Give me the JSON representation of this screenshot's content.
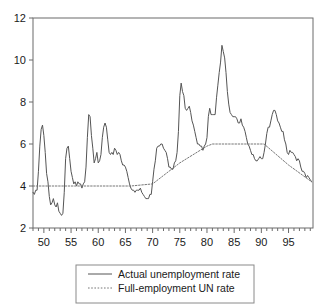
{
  "chart_data": {
    "type": "line",
    "title": "",
    "subtitle": "",
    "xlabel": "",
    "ylabel": "",
    "xlim": [
      1948.0,
      1999.5
    ],
    "ylim": [
      2,
      12
    ],
    "grid": false,
    "legend_position": "bottom-center",
    "y_ticks": [
      2,
      4,
      6,
      8,
      10,
      12
    ],
    "y_tick_labels": [
      "2",
      "4",
      "6",
      "8",
      "10",
      "12"
    ],
    "x_ticks": [
      1950,
      1955,
      1960,
      1965,
      1970,
      1975,
      1980,
      1985,
      1990,
      1995
    ],
    "x_tick_labels": [
      "50",
      "55",
      "60",
      "65",
      "70",
      "75",
      "80",
      "85",
      "90",
      "95"
    ],
    "x_minor_tick_step": 1,
    "series": [
      {
        "name": "Actual unemployment rate",
        "style": "solid",
        "color": "#555555",
        "x": [
          1948.0,
          1948.25,
          1948.5,
          1948.75,
          1949.0,
          1949.25,
          1949.5,
          1949.75,
          1950.0,
          1950.25,
          1950.5,
          1950.75,
          1951.0,
          1951.25,
          1951.5,
          1951.75,
          1952.0,
          1952.25,
          1952.5,
          1952.75,
          1953.0,
          1953.25,
          1953.5,
          1953.75,
          1954.0,
          1954.25,
          1954.5,
          1954.75,
          1955.0,
          1955.25,
          1955.5,
          1955.75,
          1956.0,
          1956.25,
          1956.5,
          1956.75,
          1957.0,
          1957.25,
          1957.5,
          1957.75,
          1958.0,
          1958.25,
          1958.5,
          1958.75,
          1959.0,
          1959.25,
          1959.5,
          1959.75,
          1960.0,
          1960.25,
          1960.5,
          1960.75,
          1961.0,
          1961.25,
          1961.5,
          1961.75,
          1962.0,
          1962.25,
          1962.5,
          1962.75,
          1963.0,
          1963.25,
          1963.5,
          1963.75,
          1964.0,
          1964.25,
          1964.5,
          1964.75,
          1965.0,
          1965.25,
          1965.5,
          1965.75,
          1966.0,
          1966.25,
          1966.5,
          1966.75,
          1967.0,
          1967.25,
          1967.5,
          1967.75,
          1968.0,
          1968.25,
          1968.5,
          1968.75,
          1969.0,
          1969.25,
          1969.5,
          1969.75,
          1970.0,
          1970.25,
          1970.5,
          1970.75,
          1971.0,
          1971.25,
          1971.5,
          1971.75,
          1972.0,
          1972.25,
          1972.5,
          1972.75,
          1973.0,
          1973.25,
          1973.5,
          1973.75,
          1974.0,
          1974.25,
          1974.5,
          1974.75,
          1975.0,
          1975.25,
          1975.5,
          1975.75,
          1976.0,
          1976.25,
          1976.5,
          1976.75,
          1977.0,
          1977.25,
          1977.5,
          1977.75,
          1978.0,
          1978.25,
          1978.5,
          1978.75,
          1979.0,
          1979.25,
          1979.5,
          1979.75,
          1980.0,
          1980.25,
          1980.5,
          1980.75,
          1981.0,
          1981.25,
          1981.5,
          1981.75,
          1982.0,
          1982.25,
          1982.5,
          1982.75,
          1983.0,
          1983.25,
          1983.5,
          1983.75,
          1984.0,
          1984.25,
          1984.5,
          1984.75,
          1985.0,
          1985.25,
          1985.5,
          1985.75,
          1986.0,
          1986.25,
          1986.5,
          1986.75,
          1987.0,
          1987.25,
          1987.5,
          1987.75,
          1988.0,
          1988.25,
          1988.5,
          1988.75,
          1989.0,
          1989.25,
          1989.5,
          1989.75,
          1990.0,
          1990.25,
          1990.5,
          1990.75,
          1991.0,
          1991.25,
          1991.5,
          1991.75,
          1992.0,
          1992.25,
          1992.5,
          1992.75,
          1993.0,
          1993.25,
          1993.5,
          1993.75,
          1994.0,
          1994.25,
          1994.5,
          1994.75,
          1995.0,
          1995.25,
          1995.5,
          1995.75,
          1996.0,
          1996.25,
          1996.5,
          1996.75,
          1997.0,
          1997.25,
          1997.5,
          1997.75,
          1998.0,
          1998.25,
          1998.5,
          1998.75,
          1999.0,
          1999.25
        ],
        "values": [
          3.7,
          3.6,
          3.8,
          3.8,
          4.7,
          5.9,
          6.7,
          6.9,
          6.4,
          5.6,
          4.6,
          4.2,
          3.5,
          3.1,
          3.2,
          3.4,
          3.1,
          3.0,
          3.2,
          2.8,
          2.7,
          2.6,
          2.7,
          3.7,
          5.3,
          5.8,
          5.9,
          5.3,
          4.7,
          4.4,
          4.1,
          4.2,
          4.0,
          4.2,
          4.1,
          4.1,
          3.9,
          4.1,
          4.2,
          4.9,
          6.3,
          7.4,
          7.3,
          6.4,
          5.8,
          5.1,
          5.3,
          5.6,
          5.1,
          5.2,
          5.5,
          6.3,
          6.8,
          7.0,
          6.8,
          6.2,
          5.6,
          5.5,
          5.6,
          5.5,
          5.8,
          5.7,
          5.5,
          5.6,
          5.5,
          5.2,
          5.0,
          5.0,
          4.9,
          4.7,
          4.4,
          4.1,
          3.9,
          3.8,
          3.8,
          3.7,
          3.8,
          3.8,
          3.8,
          3.9,
          3.7,
          3.6,
          3.5,
          3.4,
          3.4,
          3.4,
          3.6,
          3.6,
          4.2,
          4.8,
          5.2,
          5.8,
          5.9,
          5.9,
          6.0,
          6.0,
          5.8,
          5.7,
          5.6,
          5.3,
          4.9,
          4.9,
          4.8,
          4.8,
          5.1,
          5.2,
          5.6,
          6.6,
          8.3,
          8.9,
          8.5,
          8.3,
          7.7,
          7.6,
          7.7,
          7.8,
          7.5,
          7.1,
          6.9,
          6.6,
          6.3,
          6.0,
          6.0,
          5.9,
          5.9,
          5.7,
          5.9,
          6.0,
          6.3,
          7.3,
          7.7,
          7.4,
          7.4,
          7.4,
          7.4,
          8.2,
          8.8,
          9.4,
          9.9,
          10.7,
          10.4,
          10.1,
          9.4,
          8.5,
          7.9,
          7.5,
          7.4,
          7.3,
          7.3,
          7.3,
          7.2,
          7.0,
          7.0,
          7.2,
          6.9,
          6.8,
          6.6,
          6.3,
          6.0,
          5.9,
          5.7,
          5.5,
          5.5,
          5.3,
          5.2,
          5.2,
          5.3,
          5.4,
          5.3,
          5.3,
          5.6,
          6.0,
          6.5,
          6.8,
          6.8,
          7.1,
          7.4,
          7.6,
          7.6,
          7.4,
          7.1,
          7.0,
          6.8,
          6.6,
          6.6,
          6.2,
          6.0,
          5.6,
          5.5,
          5.7,
          5.6,
          5.6,
          5.5,
          5.4,
          5.2,
          5.3,
          5.2,
          4.9,
          4.7,
          4.7,
          4.6,
          4.4,
          4.5,
          4.4,
          4.3,
          4.2
        ]
      },
      {
        "name": "Full-employment UN rate",
        "style": "dotted",
        "color": "#777777",
        "x": [
          1948.0,
          1966.0,
          1970.0,
          1975.0,
          1980.0,
          1981.0,
          1988.0,
          1990.5,
          1995.0,
          1999.25
        ],
        "values": [
          4.0,
          4.0,
          4.1,
          5.1,
          5.9,
          6.0,
          6.0,
          6.0,
          5.0,
          4.2
        ]
      }
    ],
    "legend": [
      {
        "label": "Actual unemployment rate",
        "style": "solid"
      },
      {
        "label": "Full-employment UN rate",
        "style": "dotted"
      }
    ]
  }
}
